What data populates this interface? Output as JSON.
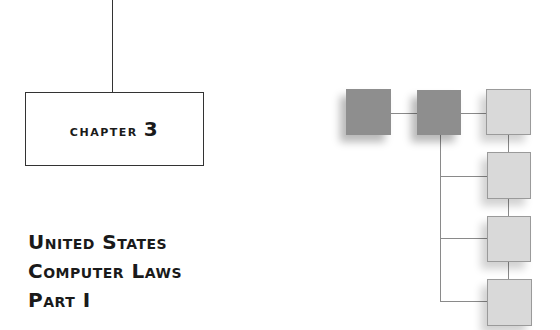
{
  "chapter": {
    "label": "Chapter",
    "number": "3"
  },
  "title": {
    "lines": [
      "United States",
      "Computer Laws",
      "Part I"
    ]
  },
  "diagram": {
    "nodes": [
      {
        "id": "node-1",
        "shade": "dark"
      },
      {
        "id": "node-2",
        "shade": "dark"
      },
      {
        "id": "node-3",
        "shade": "light"
      },
      {
        "id": "node-4",
        "shade": "light"
      },
      {
        "id": "node-5",
        "shade": "light"
      },
      {
        "id": "node-6",
        "shade": "light"
      }
    ],
    "colors": {
      "dark": "#8e8e8e",
      "light": "#d9d9d9",
      "connector": "#8a8a8a"
    }
  }
}
